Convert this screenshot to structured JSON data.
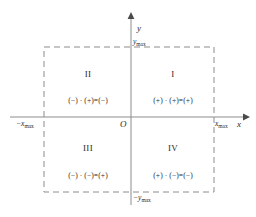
{
  "figure": {
    "background_color": "#ffffff",
    "axis_color": "#8c8c8c",
    "boundary_color": "#8c8c8c",
    "text_color": "#2a2a2a"
  },
  "axes": {
    "y_axis_label": "y",
    "x_axis_label": "x",
    "origin_label": "O"
  },
  "ticks": {
    "y_max": "y",
    "y_max_sub": "max",
    "y_min": "−y",
    "y_min_sub": "max",
    "x_max": "x",
    "x_max_sub": "max",
    "x_min": "−x",
    "x_min_sub": "max"
  },
  "quadrants": [
    {
      "name": "I",
      "position": "upper-right",
      "expression": "(+) · (+)=(+)"
    },
    {
      "name": "II",
      "position": "upper-left",
      "expression": "(−) · (+)=(−)"
    },
    {
      "name": "III",
      "position": "lower-left",
      "expression": "(−) · (−)=(+)"
    },
    {
      "name": "IV",
      "position": "lower-right",
      "expression": "(+) · (−)=(−)"
    }
  ]
}
